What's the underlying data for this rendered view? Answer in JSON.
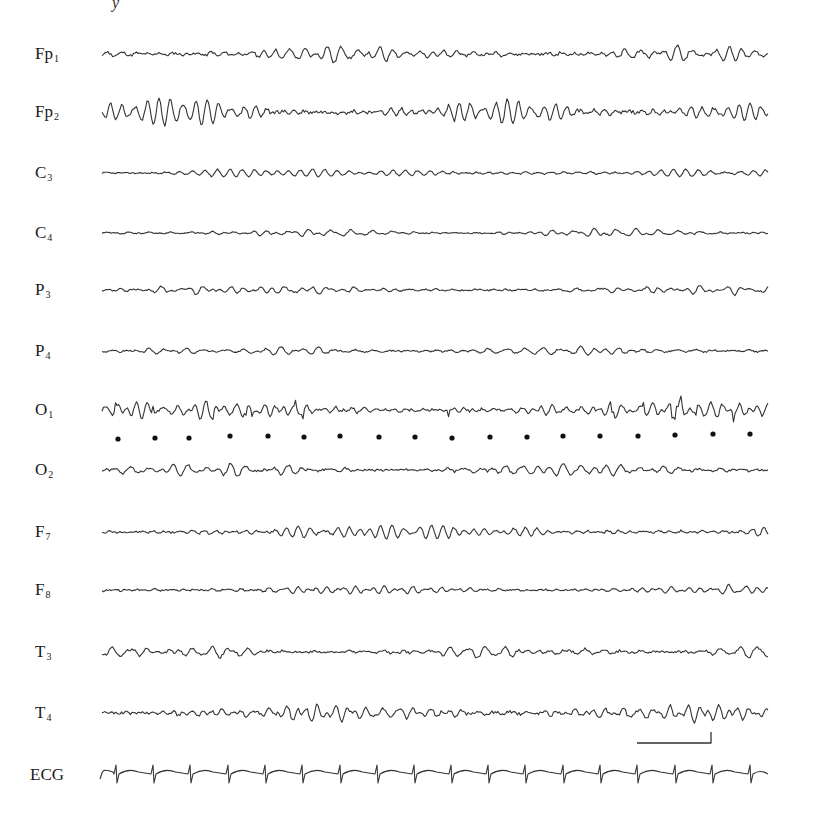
{
  "figure": {
    "top_fragment": "y",
    "trace_color": "#333333",
    "trace_x_start": 102,
    "trace_x_end": 768
  },
  "channels": [
    {
      "name": "Fp",
      "sub": "1",
      "y": 54,
      "amp": 6,
      "freq": 0.42,
      "seed": 11,
      "spiky": false
    },
    {
      "name": "Fp",
      "sub": "2",
      "y": 112,
      "amp": 8,
      "freq": 0.45,
      "seed": 23,
      "spiky": false
    },
    {
      "name": "C",
      "sub": "3",
      "y": 173,
      "amp": 3,
      "freq": 0.4,
      "seed": 37,
      "spiky": false
    },
    {
      "name": "C",
      "sub": "4",
      "y": 233,
      "amp": 3,
      "freq": 0.4,
      "seed": 41,
      "spiky": false
    },
    {
      "name": "P",
      "sub": "3",
      "y": 290,
      "amp": 3.5,
      "freq": 0.42,
      "seed": 53,
      "spiky": false
    },
    {
      "name": "P",
      "sub": "4",
      "y": 351,
      "amp": 3.5,
      "freq": 0.42,
      "seed": 67,
      "spiky": false
    },
    {
      "name": "O",
      "sub": "1",
      "y": 410,
      "amp": 6,
      "freq": 0.5,
      "seed": 79,
      "spiky": true
    },
    {
      "name": "O",
      "sub": "2",
      "y": 470,
      "amp": 5,
      "freq": 0.47,
      "seed": 83,
      "spiky": false
    },
    {
      "name": "F",
      "sub": "7",
      "y": 532,
      "amp": 4.5,
      "freq": 0.46,
      "seed": 97,
      "spiky": false
    },
    {
      "name": "F",
      "sub": "8",
      "y": 590,
      "amp": 3.5,
      "freq": 0.46,
      "seed": 101,
      "spiky": false
    },
    {
      "name": "T",
      "sub": "3",
      "y": 652,
      "amp": 5.5,
      "freq": 0.44,
      "seed": 113,
      "spiky": false
    },
    {
      "name": "T",
      "sub": "4",
      "y": 713,
      "amp": 7,
      "freq": 0.44,
      "seed": 127,
      "spiky": false
    }
  ],
  "ecg": {
    "label": "ECG",
    "y": 775,
    "qrs_x": [
      116,
      153,
      190,
      228,
      265,
      302,
      340,
      377,
      414,
      451,
      488,
      525,
      563,
      600,
      637,
      675,
      712,
      750
    ]
  },
  "timing_dots": {
    "y": [
      439,
      438,
      438,
      436,
      436,
      437,
      436,
      437,
      437,
      438,
      437,
      437,
      436,
      436,
      436,
      435,
      434,
      434
    ],
    "x": [
      118,
      155,
      189,
      230,
      268,
      304,
      340,
      379,
      415,
      452,
      490,
      527,
      563,
      600,
      638,
      675,
      713,
      750
    ]
  },
  "calibration_bar": {
    "x1": 637,
    "x2": 711,
    "y": 743,
    "tick_top": 732
  }
}
